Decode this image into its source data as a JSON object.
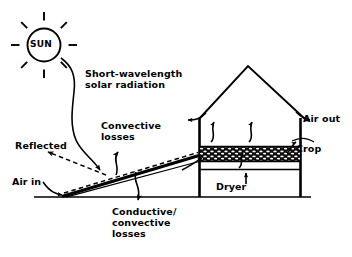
{
  "diagram": {
    "sun": {
      "label": "SUN",
      "rays": 8
    },
    "labels": {
      "solar_radiation": "Short-wavelength\nsolar radiation",
      "convective_losses": "Convective\nlosses",
      "reflected": "Reflected",
      "air_in": "Air in",
      "conductive_convective_losses": "Conductive/\nconvective\nlosses",
      "air_out": "Air out",
      "crop": "Crop",
      "dryer": "Dryer"
    },
    "colors": {
      "ink": "#000000",
      "background": "#ffffff",
      "crop_bed_fill": "#111111",
      "crop_bed_speckle": "#ffffff"
    },
    "components": [
      {
        "name": "sun",
        "label": "SUN"
      },
      {
        "name": "solar-collector",
        "label": ""
      },
      {
        "name": "barn-roof",
        "label": ""
      },
      {
        "name": "crop-bed",
        "label": "Crop"
      },
      {
        "name": "drying-chamber",
        "label": "Dryer"
      },
      {
        "name": "ground-line",
        "label": ""
      }
    ],
    "flows": [
      {
        "name": "solar-radiation-arrow",
        "style": "solid-curved",
        "label": "Short-wavelength solar radiation"
      },
      {
        "name": "reflected-arrow",
        "style": "dashed",
        "label": "Reflected"
      },
      {
        "name": "convective-losses-arrow",
        "style": "solid-curved",
        "label": "Convective losses"
      },
      {
        "name": "conductive-convective-losses-arrow",
        "style": "solid-curved",
        "label": "Conductive/convective losses"
      },
      {
        "name": "air-in-arrow",
        "style": "solid-curved",
        "label": "Air in"
      },
      {
        "name": "air-path-dashed",
        "style": "dashed",
        "label": ""
      },
      {
        "name": "air-out-arrow",
        "style": "solid",
        "label": "Air out"
      },
      {
        "name": "internal-circulation-arrows",
        "style": "solid-curved",
        "label": ""
      },
      {
        "name": "dryer-updraft-arrow",
        "style": "solid",
        "label": ""
      }
    ]
  }
}
